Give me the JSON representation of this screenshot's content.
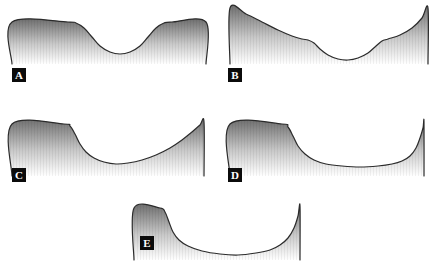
{
  "figure": {
    "width": 446,
    "height": 268,
    "background_color": "#ffffff",
    "stroke_color": "#2b2b2b",
    "fill_top_color": "#6e6e6e",
    "fill_bottom_color": "#ffffff",
    "label_background_color": "#0b0b0b",
    "label_text_color": "#ffffff"
  },
  "chart_data": {
    "type": "line",
    "title": "",
    "xlabel": "",
    "ylabel": "",
    "grid": false,
    "legend": "none",
    "panels": [
      {
        "id": "A",
        "label": "A",
        "label_x": 12,
        "label_y": 68,
        "origin_x": 10,
        "origin_y": 4,
        "width": 200,
        "height": 64,
        "axis_range_x": [
          0,
          200
        ],
        "axis_range_y": [
          0,
          64
        ],
        "shape": "symmetric-flat-shoulders-with-central-round-well",
        "curve_points": [
          [
            2,
            60
          ],
          [
            2,
            18
          ],
          [
            58,
            18
          ],
          [
            66,
            19
          ],
          [
            74,
            24
          ],
          [
            82,
            33
          ],
          [
            90,
            42
          ],
          [
            100,
            48
          ],
          [
            110,
            50
          ],
          [
            120,
            48
          ],
          [
            130,
            42
          ],
          [
            138,
            33
          ],
          [
            146,
            24
          ],
          [
            154,
            19
          ],
          [
            162,
            18
          ],
          [
            196,
            18
          ],
          [
            196,
            60
          ]
        ]
      },
      {
        "id": "B",
        "label": "B",
        "label_x": 228,
        "label_y": 68,
        "origin_x": 226,
        "origin_y": 2,
        "width": 204,
        "height": 66,
        "axis_range_x": [
          0,
          204
        ],
        "axis_range_y": [
          0,
          66
        ],
        "shape": "concave-up-walls-with-central-round-well",
        "curve_points": [
          [
            4,
            62
          ],
          [
            4,
            6
          ],
          [
            20,
            12
          ],
          [
            36,
            20
          ],
          [
            52,
            28
          ],
          [
            66,
            34
          ],
          [
            76,
            37
          ],
          [
            82,
            38
          ],
          [
            88,
            41
          ],
          [
            94,
            47
          ],
          [
            102,
            53
          ],
          [
            112,
            57
          ],
          [
            122,
            58
          ],
          [
            132,
            56
          ],
          [
            142,
            51
          ],
          [
            150,
            44
          ],
          [
            156,
            39
          ],
          [
            162,
            37
          ],
          [
            174,
            33
          ],
          [
            186,
            26
          ],
          [
            196,
            16
          ],
          [
            202,
            6
          ],
          [
            202,
            62
          ]
        ]
      },
      {
        "id": "C",
        "label": "C",
        "label_x": 12,
        "label_y": 168,
        "origin_x": 10,
        "origin_y": 118,
        "width": 200,
        "height": 62,
        "axis_range_x": [
          0,
          200
        ],
        "axis_range_y": [
          0,
          62
        ],
        "shape": "left-plateau-steep-drop-gradual-rise-to-right-peak",
        "curve_points": [
          [
            2,
            58
          ],
          [
            2,
            6
          ],
          [
            54,
            6
          ],
          [
            60,
            8
          ],
          [
            65,
            16
          ],
          [
            70,
            26
          ],
          [
            76,
            34
          ],
          [
            84,
            40
          ],
          [
            94,
            44
          ],
          [
            106,
            46
          ],
          [
            118,
            45
          ],
          [
            132,
            42
          ],
          [
            146,
            37
          ],
          [
            160,
            30
          ],
          [
            172,
            22
          ],
          [
            182,
            14
          ],
          [
            190,
            7
          ],
          [
            194,
            4
          ],
          [
            194,
            58
          ]
        ]
      },
      {
        "id": "D",
        "label": "D",
        "label_x": 228,
        "label_y": 168,
        "origin_x": 226,
        "origin_y": 118,
        "width": 206,
        "height": 62,
        "axis_range_x": [
          0,
          206
        ],
        "axis_range_y": [
          0,
          62
        ],
        "shape": "left-plateau-long-flat-valley-sharp-right-spike",
        "curve_points": [
          [
            4,
            58
          ],
          [
            4,
            6
          ],
          [
            56,
            6
          ],
          [
            62,
            9
          ],
          [
            67,
            18
          ],
          [
            72,
            28
          ],
          [
            79,
            36
          ],
          [
            88,
            42
          ],
          [
            100,
            46
          ],
          [
            116,
            48
          ],
          [
            134,
            49
          ],
          [
            152,
            48
          ],
          [
            166,
            46
          ],
          [
            176,
            43
          ],
          [
            184,
            38
          ],
          [
            190,
            30
          ],
          [
            194,
            20
          ],
          [
            197,
            10
          ],
          [
            198,
            4
          ],
          [
            198,
            58
          ]
        ]
      },
      {
        "id": "E",
        "label": "E",
        "label_x": 140,
        "label_y": 236,
        "origin_x": 128,
        "origin_y": 200,
        "width": 190,
        "height": 64,
        "axis_range_x": [
          0,
          190
        ],
        "axis_range_y": [
          0,
          64
        ],
        "shape": "narrow-left-plateau-wide-shallow-valley-sharp-right-spike",
        "curve_points": [
          [
            6,
            60
          ],
          [
            6,
            8
          ],
          [
            32,
            8
          ],
          [
            37,
            12
          ],
          [
            41,
            22
          ],
          [
            45,
            32
          ],
          [
            51,
            40
          ],
          [
            60,
            46
          ],
          [
            74,
            51
          ],
          [
            92,
            54
          ],
          [
            110,
            55
          ],
          [
            128,
            53
          ],
          [
            142,
            50
          ],
          [
            152,
            45
          ],
          [
            160,
            38
          ],
          [
            166,
            28
          ],
          [
            170,
            16
          ],
          [
            172,
            6
          ],
          [
            172,
            60
          ]
        ]
      }
    ]
  }
}
